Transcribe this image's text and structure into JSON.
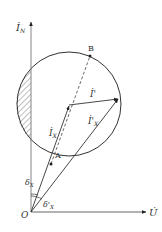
{
  "diagram": {
    "type": "phasor-diagram",
    "colors": {
      "stroke": "#333333",
      "axis": "#555555",
      "hatch": "#444444"
    },
    "origin": {
      "label": "O"
    },
    "axes": {
      "vertical": {
        "label": "İ",
        "subscript": "N"
      },
      "horizontal": {
        "label": "U̇"
      }
    },
    "points": {
      "A": {
        "label": "A"
      },
      "B": {
        "label": "B"
      }
    },
    "vectors": {
      "ix": {
        "label": "İ",
        "subscript": "X"
      },
      "ixp": {
        "label": "İ'",
        "subscript": "X"
      },
      "ip": {
        "label": "İ'"
      }
    },
    "angles": {
      "delta_x": {
        "label": "δ",
        "subscript": "X"
      },
      "delta_xp": {
        "label": "δ'",
        "subscript": "X"
      }
    }
  }
}
